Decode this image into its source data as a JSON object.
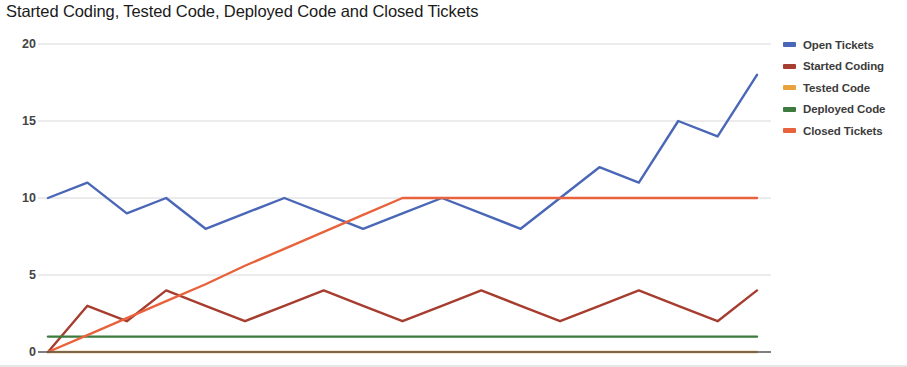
{
  "chart_data": {
    "type": "line",
    "title": "Started Coding, Tested Code, Deployed Code and Closed Tickets",
    "xlabel": "",
    "ylabel": "",
    "ylim": [
      0,
      20
    ],
    "yticks": [
      0,
      5,
      10,
      15,
      20
    ],
    "ytick_labels": [
      "0",
      "5",
      "10",
      "15",
      "20"
    ],
    "grid": true,
    "legend_position": "right",
    "x": [
      0,
      1,
      2,
      3,
      4,
      5,
      6,
      7,
      8,
      9,
      10,
      11,
      12,
      13,
      14,
      15,
      16,
      17,
      18
    ],
    "series": [
      {
        "name": "Open Tickets",
        "color": "#4a67b7",
        "values": [
          10,
          11,
          9,
          10,
          8,
          9,
          10,
          9,
          8,
          9,
          10,
          9,
          8,
          10,
          12,
          11,
          15,
          14,
          18
        ]
      },
      {
        "name": "Started Coding",
        "color": "#a63d2f",
        "values": [
          0,
          3,
          2,
          4,
          3,
          2,
          3,
          4,
          3,
          2,
          3,
          4,
          3,
          2,
          3,
          4,
          3,
          2,
          4
        ]
      },
      {
        "name": "Tested Code",
        "color": "#e8a33d",
        "values": [
          0,
          0,
          0,
          0,
          0,
          0,
          0,
          0,
          0,
          0,
          0,
          0,
          0,
          0,
          0,
          0,
          0,
          0,
          0
        ]
      },
      {
        "name": "Deployed Code",
        "color": "#3d7a3d",
        "values": [
          1,
          1,
          1,
          1,
          1,
          1,
          1,
          1,
          1,
          1,
          1,
          1,
          1,
          1,
          1,
          1,
          1,
          1,
          1
        ]
      },
      {
        "name": "Closed Tickets",
        "color": "#e8623c",
        "values": [
          0,
          1.1,
          2.2,
          3.3,
          4.4,
          5.6,
          6.7,
          7.8,
          8.9,
          10,
          10,
          10,
          10,
          10,
          10,
          10,
          10,
          10,
          10
        ]
      }
    ]
  },
  "legend": {
    "items": [
      {
        "label": "Open Tickets",
        "color": "#4a67b7"
      },
      {
        "label": "Started Coding",
        "color": "#a63d2f"
      },
      {
        "label": "Tested Code",
        "color": "#e8a33d"
      },
      {
        "label": "Deployed Code",
        "color": "#3d7a3d"
      },
      {
        "label": "Closed Tickets",
        "color": "#e8623c"
      }
    ]
  },
  "axis": {
    "baseline_color": "#555555",
    "gridline_color": "#d8d8d8"
  }
}
